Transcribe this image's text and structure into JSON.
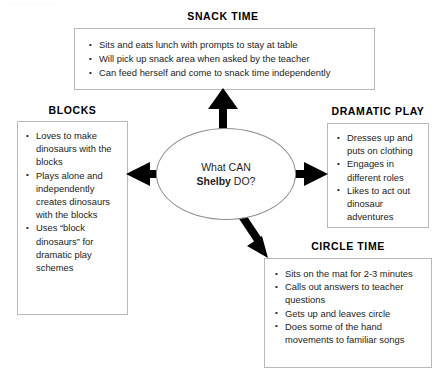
{
  "page": {
    "faint_top_text": "........................",
    "center": {
      "line1": "What CAN",
      "name": "Shelby",
      "line2_suffix": " DO?"
    }
  },
  "panels": {
    "snack": {
      "heading": "SNACK TIME",
      "items": [
        "Sits and eats lunch with prompts to stay at table",
        "Will pick up snack area when asked by the teacher",
        "Can feed herself and come to snack time independently"
      ]
    },
    "blocks": {
      "heading": "BLOCKS",
      "items": [
        "Loves to make dinosaurs with the blocks",
        "Plays alone and independently creates dinosaurs with the blocks",
        "Uses “block dinosaurs” for dramatic play schemes"
      ]
    },
    "dramatic": {
      "heading": "DRAMATIC PLAY",
      "items": [
        "Dresses up and puts on clothing",
        "Engages in different roles",
        "Likes to act out dinosaur adventures"
      ]
    },
    "circle": {
      "heading": "CIRCLE TIME",
      "items": [
        "Sits on the mat for 2-3 minutes",
        "Calls out answers to teacher questions",
        "Gets up and leaves circle",
        "Does some of the hand movements to familiar songs"
      ]
    }
  },
  "arrows": [
    {
      "name": "arrow-up-to-snack",
      "direction": "up"
    },
    {
      "name": "arrow-left-to-blocks",
      "direction": "left"
    },
    {
      "name": "arrow-right-to-dramatic-play",
      "direction": "right"
    },
    {
      "name": "arrow-down-right-to-circle-time",
      "direction": "down-right"
    }
  ],
  "colors": {
    "arrow": "#000000",
    "border": "#b9b9b9",
    "oval_border": "#8d8d8d",
    "text": "#232323",
    "background": "#ffffff"
  }
}
